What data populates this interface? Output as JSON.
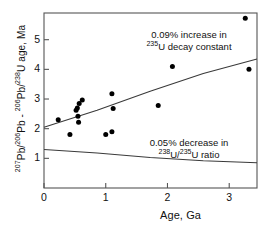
{
  "chart_data": {
    "type": "scatter",
    "title": "",
    "xlabel": "Age, Ga",
    "ylabel": "207Pb/206Pb - 206Pb/238U age, Ma",
    "ylabel_parts": {
      "a_sup": "207",
      "a_base": "Pb/",
      "b_sup": "206",
      "b_base": "Pb",
      "dash": " - ",
      "c_sup": "206",
      "c_base": "Pb/",
      "d_sup": "238",
      "d_base": "U age, Ma"
    },
    "xlim": [
      0,
      3.45
    ],
    "ylim": [
      0,
      5.9
    ],
    "xticks": [
      0,
      1,
      2,
      3
    ],
    "xtick_labels": [
      "0",
      "1",
      "2",
      "3"
    ],
    "yticks": [
      1,
      2,
      3,
      4,
      5
    ],
    "ytick_labels": [
      "1",
      "2",
      "3",
      "4",
      "5"
    ],
    "grid": false,
    "legend": "none",
    "marker": "filled-circle",
    "marker_color": "#000000",
    "line_color": "#3a3a3a",
    "frame_color": "#555555",
    "points": [
      {
        "x": 0.23,
        "y": 2.3
      },
      {
        "x": 0.42,
        "y": 1.8
      },
      {
        "x": 0.52,
        "y": 2.62
      },
      {
        "x": 0.54,
        "y": 2.7
      },
      {
        "x": 0.55,
        "y": 2.42
      },
      {
        "x": 0.56,
        "y": 2.22
      },
      {
        "x": 0.57,
        "y": 2.85
      },
      {
        "x": 0.62,
        "y": 2.97
      },
      {
        "x": 1.0,
        "y": 1.8
      },
      {
        "x": 1.1,
        "y": 1.9
      },
      {
        "x": 1.1,
        "y": 3.18
      },
      {
        "x": 1.12,
        "y": 2.68
      },
      {
        "x": 1.85,
        "y": 2.78
      },
      {
        "x": 2.08,
        "y": 4.1
      },
      {
        "x": 3.26,
        "y": 5.72
      },
      {
        "x": 3.32,
        "y": 4.0
      }
    ],
    "curves": [
      {
        "name": "0.09% increase in 235U decay constant",
        "points": [
          [
            0,
            2.05
          ],
          [
            0.86,
            2.62
          ],
          [
            1.72,
            3.26
          ],
          [
            2.58,
            3.86
          ],
          [
            3.45,
            4.35
          ]
        ]
      },
      {
        "name": "0.05% decrease in 238U/235U ratio",
        "points": [
          [
            0,
            1.3
          ],
          [
            0.86,
            1.18
          ],
          [
            1.72,
            1.03
          ],
          [
            2.58,
            0.92
          ],
          [
            3.45,
            0.85
          ]
        ]
      }
    ],
    "annotations": [
      {
        "id": "upper",
        "line1": "0.09% increase in",
        "line2_sup": "235",
        "line2_base": "U decay constant"
      },
      {
        "id": "lower",
        "line1": "0.05% decrease in",
        "line2_sup_a": "238",
        "line2_mid": "U/",
        "line2_sup_b": "235",
        "line2_base": "U ratio"
      }
    ]
  }
}
